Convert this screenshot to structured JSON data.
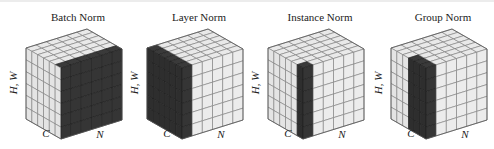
{
  "figure": {
    "grid_size": 6,
    "colors": {
      "light_face_top": "#e9e9e9",
      "light_face_left": "#e4e4e4",
      "light_face_right": "#ececec",
      "grid_line": "#7a7a7a",
      "dark_face_top": "#3a3a3a",
      "dark_face_left": "#2e2e2e",
      "dark_face_right": "#353535",
      "dark_grid_line": "#1e1e1e",
      "edge": "#555555"
    },
    "panels": [
      {
        "title": "Batch Norm",
        "axis_hw": "H, W",
        "axis_c": "C",
        "axis_n": "N",
        "highlight": {
          "type": "batch",
          "c_from": 0,
          "c_to": 6,
          "n_from": 0,
          "n_to": 6,
          "note": "all N, all H,W, one channel"
        }
      },
      {
        "title": "Layer Norm",
        "axis_hw": "H, W",
        "axis_c": "C",
        "axis_n": "N",
        "highlight": {
          "type": "layer",
          "note": "all C, all H,W, one sample"
        }
      },
      {
        "title": "Instance Norm",
        "axis_hw": "H, W",
        "axis_c": "C",
        "axis_n": "N",
        "highlight": {
          "type": "instance",
          "c_cols": 1,
          "note": "one C, all H,W, one sample"
        }
      },
      {
        "title": "Group Norm",
        "axis_hw": "H, W",
        "axis_c": "C",
        "axis_n": "N",
        "highlight": {
          "type": "group",
          "c_cols": 3,
          "note": "group of C, all H,W, one sample"
        }
      }
    ]
  }
}
